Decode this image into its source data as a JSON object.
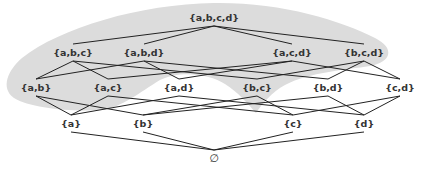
{
  "diagram": {
    "type": "hasse-diagram",
    "colors": {
      "shade": "#dcdcdc",
      "edge": "#222222",
      "text": "#333333",
      "background": "#ffffff"
    },
    "shaded_nodes": [
      "{a,b,c,d}",
      "{a,b,c}",
      "{a,b,d}",
      "{a,c,d}",
      "{b,c,d}",
      "{a,b}",
      "{a,c}",
      "{b,c}"
    ],
    "nodes": [
      {
        "id": "abcd",
        "label": "{a,b,c,d}",
        "x": 214,
        "y": 17
      },
      {
        "id": "abc",
        "label": "{a,b,c}",
        "x": 73,
        "y": 52
      },
      {
        "id": "abd",
        "label": "{a,b,d}",
        "x": 144,
        "y": 52
      },
      {
        "id": "acd",
        "label": "{a,c,d}",
        "x": 292,
        "y": 52
      },
      {
        "id": "bcd",
        "label": "{b,c,d}",
        "x": 364,
        "y": 52
      },
      {
        "id": "ab",
        "label": "{a,b}",
        "x": 36,
        "y": 87
      },
      {
        "id": "ac",
        "label": "{a,c}",
        "x": 108,
        "y": 87
      },
      {
        "id": "ad",
        "label": "{a,d}",
        "x": 179,
        "y": 87
      },
      {
        "id": "bc",
        "label": "{b,c}",
        "x": 257,
        "y": 87
      },
      {
        "id": "bd",
        "label": "{b,d}",
        "x": 328,
        "y": 87
      },
      {
        "id": "cd",
        "label": "{c,d}",
        "x": 400,
        "y": 87
      },
      {
        "id": "a",
        "label": "{a}",
        "x": 71,
        "y": 123
      },
      {
        "id": "b",
        "label": "{b}",
        "x": 143,
        "y": 123
      },
      {
        "id": "c",
        "label": "{c}",
        "x": 293,
        "y": 123
      },
      {
        "id": "d",
        "label": "{d}",
        "x": 364,
        "y": 123
      },
      {
        "id": "empty",
        "label": "∅",
        "x": 214,
        "y": 158
      }
    ],
    "edges": [
      [
        "abcd",
        "abc"
      ],
      [
        "abcd",
        "abd"
      ],
      [
        "abcd",
        "acd"
      ],
      [
        "abcd",
        "bcd"
      ],
      [
        "abc",
        "ab"
      ],
      [
        "abc",
        "ac"
      ],
      [
        "abc",
        "bc"
      ],
      [
        "abd",
        "ab"
      ],
      [
        "abd",
        "ad"
      ],
      [
        "abd",
        "bd"
      ],
      [
        "acd",
        "ac"
      ],
      [
        "acd",
        "ad"
      ],
      [
        "acd",
        "cd"
      ],
      [
        "bcd",
        "bc"
      ],
      [
        "bcd",
        "bd"
      ],
      [
        "bcd",
        "cd"
      ],
      [
        "ab",
        "a"
      ],
      [
        "ab",
        "b"
      ],
      [
        "ac",
        "a"
      ],
      [
        "ac",
        "c"
      ],
      [
        "ad",
        "a"
      ],
      [
        "ad",
        "d"
      ],
      [
        "bc",
        "b"
      ],
      [
        "bc",
        "c"
      ],
      [
        "bd",
        "b"
      ],
      [
        "bd",
        "d"
      ],
      [
        "cd",
        "c"
      ],
      [
        "cd",
        "d"
      ],
      [
        "a",
        "empty"
      ],
      [
        "b",
        "empty"
      ],
      [
        "c",
        "empty"
      ],
      [
        "d",
        "empty"
      ]
    ]
  }
}
